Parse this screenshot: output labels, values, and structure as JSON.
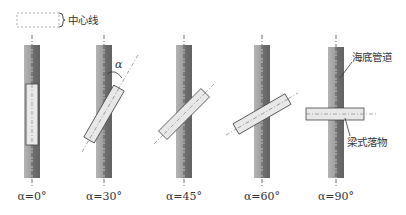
{
  "legend": {
    "centerline_label": "中心线"
  },
  "annotations": {
    "pipeline_label": "海底管道",
    "falling_object_label": "梁式落物",
    "angle_symbol": "α"
  },
  "colors": {
    "pipe_light": "#a8a8a8",
    "pipe_dark": "#6e6e6e",
    "object_fill": "#e6e6e6",
    "object_stroke": "#444444",
    "centerline": "#444444"
  },
  "cases": [
    {
      "label": "α=0°",
      "angle": 0
    },
    {
      "label": "α=30°",
      "angle": 30
    },
    {
      "label": "α=45°",
      "angle": 45
    },
    {
      "label": "α=60°",
      "angle": 60
    },
    {
      "label": "α=90°",
      "angle": 90
    }
  ]
}
